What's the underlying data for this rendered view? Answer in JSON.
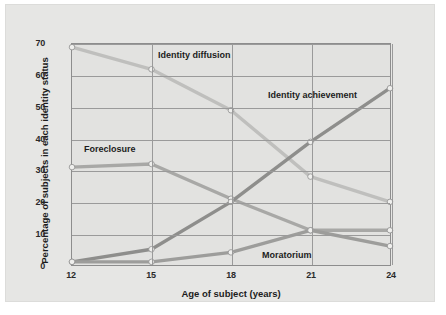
{
  "chart_data": {
    "type": "line",
    "title": "",
    "xlabel": "Age of subject (years)",
    "ylabel": "Percentage of subjects in each identity status",
    "x": [
      12,
      15,
      18,
      21,
      24
    ],
    "xticklabels": [
      "12",
      "15",
      "18",
      "21",
      "24"
    ],
    "yticklabels": [
      "0",
      "10",
      "20",
      "30",
      "40",
      "50",
      "60",
      "70"
    ],
    "yticks": [
      0,
      10,
      20,
      30,
      40,
      50,
      60,
      70
    ],
    "xlim": [
      12,
      24
    ],
    "ylim": [
      0,
      70
    ],
    "grid": true,
    "legend_position": "inline-annotations",
    "series": [
      {
        "name": "Identity diffusion",
        "values": [
          69,
          62,
          49,
          28,
          20
        ],
        "color": "#bfbfbd",
        "label_x": 152,
        "label_y": 45
      },
      {
        "name": "Foreclosure",
        "values": [
          31,
          32,
          21,
          11,
          11
        ],
        "color": "#a8a8a6",
        "label_x": 78,
        "label_y": 139
      },
      {
        "name": "Identity achievement",
        "values": [
          1,
          5,
          20,
          39,
          56
        ],
        "color": "#8e8e8c",
        "label_x": 262,
        "label_y": 85
      },
      {
        "name": "Moratorium",
        "values": [
          1,
          1,
          4,
          11,
          6
        ],
        "color": "#9d9d9b",
        "label_x": 256,
        "label_y": 245
      }
    ],
    "marker": "circle",
    "marker_color": "#efefed",
    "marker_edge_color": "#8d8d8d",
    "plot_background": "#e2e2e0",
    "card_background": "#e6e6e4",
    "page_background": "#ffffff",
    "axis_color": "#8d8d8d",
    "grid_color": "#9a9a9a"
  }
}
